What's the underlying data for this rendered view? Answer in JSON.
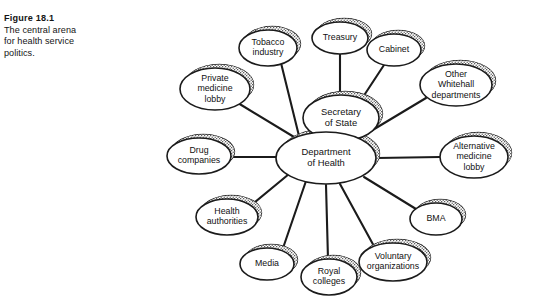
{
  "caption": {
    "figure_label": "Figure 18.1",
    "text_line_1": "The central arena",
    "text_line_2": "for health service",
    "text_line_3": "politics."
  },
  "colors": {
    "background": "#ffffff",
    "stroke": "#1b1b1b",
    "text": "#111111",
    "shadow_fill": "#b9b9b9",
    "node_fill": "#ffffff"
  },
  "diagram": {
    "type": "radial-hub-and-spoke",
    "hub_nodes": [
      {
        "id": "secretary-of-state",
        "label_lines": [
          "Secretary",
          "of State"
        ],
        "cx": 341,
        "cy": 118,
        "rx": 38,
        "ry": 23
      },
      {
        "id": "department-of-health",
        "label_lines": [
          "Department",
          "of Health"
        ],
        "cx": 326,
        "cy": 158,
        "rx": 50,
        "ry": 26
      }
    ],
    "satellite_nodes": [
      {
        "id": "tobacco-industry",
        "label_lines": [
          "Tobacco",
          "industry"
        ],
        "cx": 268,
        "cy": 48,
        "rx": 29,
        "ry": 18,
        "connects_to": "department-of-health"
      },
      {
        "id": "treasury",
        "label_lines": [
          "Treasury"
        ],
        "cx": 340,
        "cy": 38,
        "rx": 28,
        "ry": 16,
        "connects_to": "secretary-of-state"
      },
      {
        "id": "cabinet",
        "label_lines": [
          "Cabinet"
        ],
        "cx": 394,
        "cy": 50,
        "rx": 27,
        "ry": 16,
        "connects_to": "secretary-of-state"
      },
      {
        "id": "other-whitehall-departments",
        "label_lines": [
          "Other",
          "Whitehall",
          "departments"
        ],
        "cx": 456,
        "cy": 85,
        "rx": 36,
        "ry": 21,
        "connects_to": "secretary-of-state"
      },
      {
        "id": "alternative-medicine-lobby",
        "label_lines": [
          "Alternative",
          "medicine",
          "lobby"
        ],
        "cx": 474,
        "cy": 157,
        "rx": 34,
        "ry": 21,
        "connects_to": "department-of-health"
      },
      {
        "id": "bma",
        "label_lines": [
          "BMA"
        ],
        "cx": 436,
        "cy": 219,
        "rx": 26,
        "ry": 16,
        "connects_to": "department-of-health"
      },
      {
        "id": "voluntary-organizations",
        "label_lines": [
          "Voluntary",
          "organizations"
        ],
        "cx": 393,
        "cy": 262,
        "rx": 34,
        "ry": 19,
        "connects_to": "department-of-health"
      },
      {
        "id": "royal-colleges",
        "label_lines": [
          "Royal",
          "colleges"
        ],
        "cx": 329,
        "cy": 277,
        "rx": 28,
        "ry": 18,
        "connects_to": "department-of-health"
      },
      {
        "id": "media",
        "label_lines": [
          "Media"
        ],
        "cx": 267,
        "cy": 264,
        "rx": 27,
        "ry": 16,
        "connects_to": "department-of-health"
      },
      {
        "id": "health-authorities",
        "label_lines": [
          "Health",
          "authorities"
        ],
        "cx": 227,
        "cy": 217,
        "rx": 31,
        "ry": 18,
        "connects_to": "department-of-health"
      },
      {
        "id": "drug-companies",
        "label_lines": [
          "Drug",
          "companies"
        ],
        "cx": 199,
        "cy": 156,
        "rx": 32,
        "ry": 18,
        "connects_to": "department-of-health"
      },
      {
        "id": "private-medicine-lobby",
        "label_lines": [
          "Private",
          "medicine",
          "lobby"
        ],
        "cx": 215,
        "cy": 89,
        "rx": 35,
        "ry": 21,
        "connects_to": "department-of-health"
      }
    ],
    "edges": [
      {
        "from": "tobacco-industry",
        "to": "department-of-health",
        "x1": 281,
        "y1": 63,
        "x2": 300,
        "y2": 140
      },
      {
        "from": "treasury",
        "to": "secretary-of-state",
        "x1": 340,
        "y1": 54,
        "x2": 340,
        "y2": 95
      },
      {
        "from": "cabinet",
        "to": "secretary-of-state",
        "x1": 384,
        "y1": 65,
        "x2": 361,
        "y2": 100
      },
      {
        "from": "other-whitehall-departments",
        "to": "secretary-of-state",
        "x1": 426,
        "y1": 98,
        "x2": 361,
        "y2": 137
      },
      {
        "from": "alternative-medicine-lobby",
        "to": "department-of-health",
        "x1": 440,
        "y1": 157,
        "x2": 377,
        "y2": 158
      },
      {
        "from": "bma",
        "to": "department-of-health",
        "x1": 416,
        "y1": 209,
        "x2": 364,
        "y2": 177
      },
      {
        "from": "voluntary-organizations",
        "to": "department-of-health",
        "x1": 375,
        "y1": 248,
        "x2": 340,
        "y2": 184
      },
      {
        "from": "royal-colleges",
        "to": "department-of-health",
        "x1": 328,
        "y1": 259,
        "x2": 326,
        "y2": 185
      },
      {
        "from": "media",
        "to": "department-of-health",
        "x1": 282,
        "y1": 251,
        "x2": 306,
        "y2": 181
      },
      {
        "from": "health-authorities",
        "to": "department-of-health",
        "x1": 249,
        "y1": 207,
        "x2": 289,
        "y2": 174
      },
      {
        "from": "drug-companies",
        "to": "department-of-health",
        "x1": 231,
        "y1": 157,
        "x2": 276,
        "y2": 157
      },
      {
        "from": "private-medicine-lobby",
        "to": "department-of-health",
        "x1": 238,
        "y1": 103,
        "x2": 299,
        "y2": 140
      }
    ]
  }
}
